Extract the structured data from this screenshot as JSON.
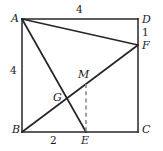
{
  "figure": {
    "type": "geometry-diagram",
    "background_color": "#ffffff",
    "stroke_color": "#262626",
    "dash_color": "#8c8c8c",
    "vertices": {
      "A": {
        "label": "A",
        "x": 22,
        "y": 19,
        "label_x": 11,
        "label_y": 13
      },
      "D": {
        "label": "D",
        "x": 138,
        "y": 19,
        "label_x": 142,
        "label_y": 14
      },
      "B": {
        "label": "B",
        "x": 22,
        "y": 132,
        "label_x": 12,
        "label_y": 124
      },
      "C": {
        "label": "C",
        "x": 138,
        "y": 132,
        "label_x": 142,
        "label_y": 124
      },
      "F": {
        "label": "F",
        "x": 138,
        "y": 45,
        "label_x": 142,
        "label_y": 40
      },
      "E": {
        "label": "E",
        "x": 86,
        "y": 132,
        "label_x": 81,
        "label_y": 135
      },
      "G": {
        "label": "G",
        "x": 69,
        "y": 100,
        "label_x": 53,
        "label_y": 92
      },
      "M": {
        "label": "M",
        "x": 86,
        "y": 84,
        "label_x": 78,
        "label_y": 69
      }
    },
    "segments": [
      {
        "name": "side-AD",
        "from": "A",
        "to": "D",
        "style": "solid"
      },
      {
        "name": "side-DC",
        "from": "D",
        "to": "C",
        "style": "solid"
      },
      {
        "name": "side-CB",
        "from": "C",
        "to": "B",
        "style": "solid"
      },
      {
        "name": "side-BA",
        "from": "B",
        "to": "A",
        "style": "solid"
      },
      {
        "name": "segment-AF",
        "from": "A",
        "to": "F",
        "style": "solid"
      },
      {
        "name": "segment-AE",
        "from": "A",
        "to": "E",
        "style": "solid"
      },
      {
        "name": "segment-BF",
        "from": "B",
        "to": "F",
        "style": "solid"
      },
      {
        "name": "segment-ME",
        "from": "M",
        "to": "E",
        "style": "dashed"
      }
    ],
    "measures": [
      {
        "name": "measure-AD",
        "value": "4",
        "x": 76,
        "y": 4,
        "edge": "top"
      },
      {
        "name": "measure-AB",
        "value": "4",
        "x": 10,
        "y": 65,
        "edge": "left"
      },
      {
        "name": "measure-DF",
        "value": "1",
        "x": 142,
        "y": 27,
        "edge": "right"
      },
      {
        "name": "measure-BE",
        "value": "2",
        "x": 50,
        "y": 135,
        "edge": "bottom"
      }
    ]
  }
}
